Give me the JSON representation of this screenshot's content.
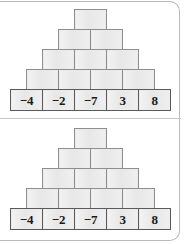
{
  "worksheet": {
    "panels": [
      {
        "name": "number-pyramid-1",
        "rows": [
          {
            "level": 1,
            "cells": [
              {
                "value": ""
              }
            ]
          },
          {
            "level": 2,
            "cells": [
              {
                "value": ""
              },
              {
                "value": ""
              }
            ]
          },
          {
            "level": 3,
            "cells": [
              {
                "value": ""
              },
              {
                "value": ""
              },
              {
                "value": ""
              }
            ]
          },
          {
            "level": 4,
            "cells": [
              {
                "value": ""
              },
              {
                "value": ""
              },
              {
                "value": ""
              },
              {
                "value": ""
              }
            ]
          },
          {
            "level": 5,
            "cells": [
              {
                "value": "−4"
              },
              {
                "value": "−2"
              },
              {
                "value": "−7"
              },
              {
                "value": "3"
              },
              {
                "value": "8"
              }
            ]
          }
        ]
      },
      {
        "name": "number-pyramid-2",
        "rows": [
          {
            "level": 1,
            "cells": [
              {
                "value": ""
              }
            ]
          },
          {
            "level": 2,
            "cells": [
              {
                "value": ""
              },
              {
                "value": ""
              }
            ]
          },
          {
            "level": 3,
            "cells": [
              {
                "value": ""
              },
              {
                "value": ""
              },
              {
                "value": ""
              }
            ]
          },
          {
            "level": 4,
            "cells": [
              {
                "value": ""
              },
              {
                "value": ""
              },
              {
                "value": ""
              },
              {
                "value": ""
              }
            ]
          },
          {
            "level": 5,
            "cells": [
              {
                "value": "−4"
              },
              {
                "value": "−2"
              },
              {
                "value": "−7"
              },
              {
                "value": "3"
              },
              {
                "value": "8"
              }
            ]
          }
        ]
      }
    ],
    "colors": {
      "block_fill": "#ebebeb",
      "block_border": "#8e8e8e",
      "base_block_border": "#5a5a5a",
      "card_border": "#b9b9b9",
      "divider": "#c9c9c9",
      "value_text": "#1a1a1a",
      "page_background": "#ffffff"
    }
  }
}
